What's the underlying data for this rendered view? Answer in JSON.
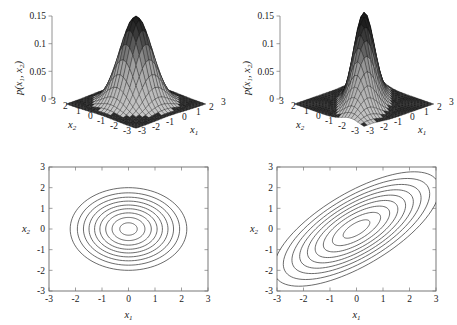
{
  "figure": {
    "panels": [
      "surface-left",
      "surface-right",
      "contour-left",
      "contour-right"
    ]
  },
  "labels": {
    "x1": "x",
    "x1_sub": "1",
    "x2": "x",
    "x2_sub": "2",
    "pdf": "p(x",
    "pdf_sub1": "1",
    "pdf_mid": ", x",
    "pdf_sub2": "2",
    "pdf_end": ")"
  },
  "chart_data": [
    {
      "type": "surface",
      "name": "surface-left",
      "title": "",
      "xlabel": "x1",
      "ylabel": "x2",
      "zlabel": "p(x1, x2)",
      "xlim": [
        -3,
        3
      ],
      "ylim": [
        -3,
        3
      ],
      "zlim": [
        0,
        0.15
      ],
      "xticks": [
        -3,
        -2,
        -1,
        0,
        1,
        2,
        3
      ],
      "yticks": [
        3,
        2,
        1,
        0,
        -1,
        -2,
        -3
      ],
      "zticks": [
        0,
        0.05,
        0.1,
        0.15
      ],
      "ztick_labels": [
        "0",
        "0.05",
        "0.1",
        "0.15"
      ],
      "distribution": "bivariate-gaussian",
      "mean": [
        0,
        0
      ],
      "covariance": [
        [
          1.0,
          0.0
        ],
        [
          0.0,
          1.0
        ]
      ],
      "peak_value": 0.15,
      "grid": true,
      "legend": "none",
      "description": "Isotropic uncorrelated bivariate Gaussian surface, symmetric circular cross-section, sharp central peak at 0.15"
    },
    {
      "type": "surface",
      "name": "surface-right",
      "title": "",
      "xlabel": "x1",
      "ylabel": "x2",
      "zlabel": "p(x1, x2)",
      "xlim": [
        -3,
        3
      ],
      "ylim": [
        -3,
        3
      ],
      "zlim": [
        0,
        0.15
      ],
      "xticks": [
        -3,
        -2,
        -1,
        0,
        1,
        2,
        3
      ],
      "yticks": [
        3,
        2,
        1,
        0,
        -1,
        -2,
        -3
      ],
      "zticks": [
        0,
        0.05,
        0.1,
        0.15
      ],
      "ztick_labels": [
        "0",
        "0.05",
        "0.1",
        "0.15"
      ],
      "distribution": "bivariate-gaussian",
      "mean": [
        0,
        0
      ],
      "covariance": [
        [
          1.6,
          1.0
        ],
        [
          1.0,
          1.2
        ]
      ],
      "peak_value": 0.115,
      "grid": true,
      "legend": "none",
      "description": "Correlated bivariate Gaussian surface, elongated ridge along the x1=x2 diagonal, lower broader peak near 0.115"
    },
    {
      "type": "contour",
      "name": "contour-left",
      "title": "",
      "xlabel": "x1",
      "ylabel": "x2",
      "xlim": [
        -3,
        3
      ],
      "ylim": [
        -3,
        3
      ],
      "xticks": [
        -3,
        -2,
        -1,
        0,
        1,
        2,
        3
      ],
      "xtick_labels": [
        "-3",
        "-2",
        "-1",
        "0",
        "1",
        "2",
        "3"
      ],
      "yticks": [
        -3,
        -2,
        -1,
        0,
        1,
        2,
        3
      ],
      "ytick_labels": [
        "-3",
        "-2",
        "-1",
        "0",
        "1",
        "2",
        "3"
      ],
      "n_levels": 9,
      "center": [
        0,
        0
      ],
      "tilt_degrees": 0,
      "semi_axes_x": [
        0.33,
        0.62,
        0.86,
        1.08,
        1.28,
        1.49,
        1.7,
        1.93,
        2.2
      ],
      "semi_axes_y": [
        0.3,
        0.56,
        0.78,
        0.98,
        1.16,
        1.35,
        1.54,
        1.75,
        2.0
      ],
      "grid": false,
      "legend": "none",
      "description": "Near-circular concentric contour rings of the uncorrelated Gaussian, slightly wider in x1 than x2"
    },
    {
      "type": "contour",
      "name": "contour-right",
      "title": "",
      "xlabel": "x1",
      "ylabel": "x2",
      "xlim": [
        -3,
        3
      ],
      "ylim": [
        -3,
        3
      ],
      "xticks": [
        -3,
        -2,
        -1,
        0,
        1,
        2,
        3
      ],
      "xtick_labels": [
        "-3",
        "-2",
        "-1",
        "0",
        "1",
        "2",
        "3"
      ],
      "yticks": [
        -3,
        -2,
        -1,
        0,
        1,
        2,
        3
      ],
      "ytick_labels": [
        "-3",
        "-2",
        "-1",
        "0",
        "1",
        "2",
        "3"
      ],
      "n_levels": 9,
      "center": [
        0,
        0
      ],
      "tilt_degrees": 40,
      "semi_axes_major": [
        0.62,
        1.12,
        1.54,
        1.92,
        2.28,
        2.64,
        3.0,
        3.4,
        3.85
      ],
      "semi_axes_minor": [
        0.26,
        0.47,
        0.65,
        0.81,
        0.96,
        1.11,
        1.26,
        1.43,
        1.62
      ],
      "grid": false,
      "legend": "none",
      "description": "Elongated elliptical contours tilted about 40 degrees indicating strong positive correlation between x1 and x2"
    }
  ]
}
